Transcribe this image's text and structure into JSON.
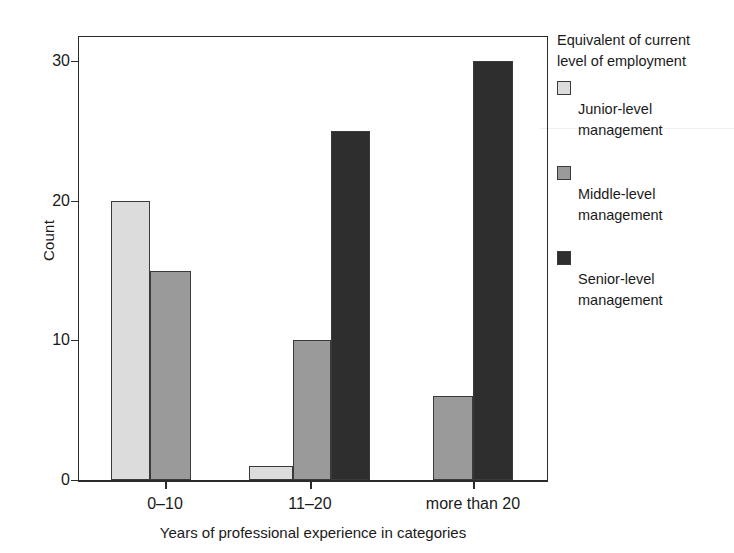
{
  "chart_data": {
    "type": "bar",
    "title": "",
    "subtitle": "",
    "xlabel": "Years of professional experience in categories",
    "ylabel": "Count",
    "categories": [
      "0–10",
      "11–20",
      "more than 20"
    ],
    "series": [
      {
        "name": "Junior-level management",
        "values": [
          20,
          1,
          0
        ],
        "color": "#dcdcdc"
      },
      {
        "name": "Middle-level management",
        "values": [
          15,
          10,
          6
        ],
        "color": "#9a9a9a"
      },
      {
        "name": "Senior-level management",
        "values": [
          0,
          25,
          30
        ],
        "color": "#2e2e2e"
      }
    ],
    "ylim": [
      0,
      31.8
    ],
    "yticks": [
      0,
      10,
      20,
      30
    ],
    "ytick_labels": [
      "0",
      "10",
      "20",
      "30"
    ],
    "grid": false,
    "legend_position": "right",
    "legend_title": "Equivalent of current level of employment"
  },
  "axes": {
    "y_title": "Count",
    "x_title": "Years of professional experience in categories",
    "y_ticks": [
      {
        "label": "30",
        "value": 30
      },
      {
        "label": "20",
        "value": 20
      },
      {
        "label": "10",
        "value": 10
      },
      {
        "label": "0",
        "value": 0
      }
    ],
    "x_ticks": [
      {
        "label": "0–10"
      },
      {
        "label": "11–20"
      },
      {
        "label": "more than 20"
      }
    ]
  },
  "legend": {
    "title_line1": "Equivalent of current",
    "title_line2": "level of employment",
    "entries": [
      {
        "line1": "Junior-level",
        "line2": "management",
        "color": "#dcdcdc"
      },
      {
        "line1": "Middle-level",
        "line2": "management",
        "color": "#9a9a9a"
      },
      {
        "line1": "Senior-level",
        "line2": "management",
        "color": "#2e2e2e"
      }
    ]
  },
  "colors": {
    "junior": "#dcdcdc",
    "middle": "#9a9a9a",
    "senior": "#2e2e2e",
    "outline": "#3a3a3a",
    "axis": "#2b2b2b",
    "background": "#ffffff"
  }
}
